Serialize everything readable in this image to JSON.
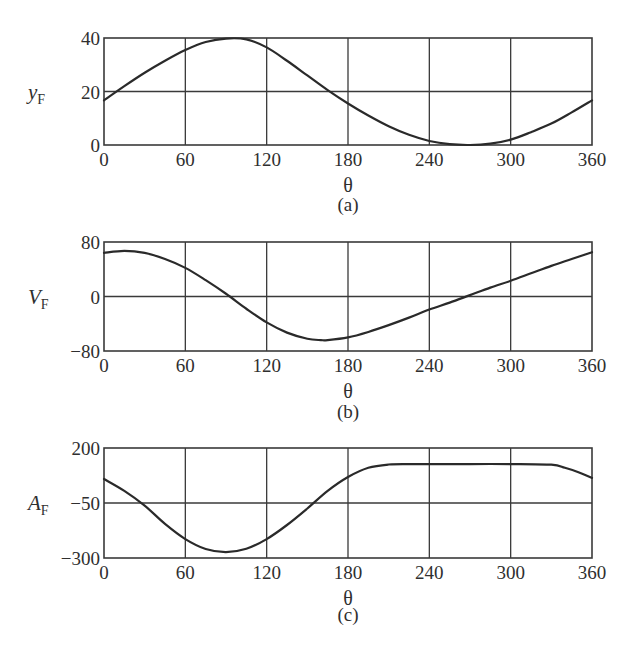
{
  "figure": {
    "panels": [
      {
        "id": "a",
        "caption": "(a)",
        "ylabel_main": "y",
        "ylabel_sub": "F",
        "xlabel": "θ"
      },
      {
        "id": "b",
        "caption": "(b)",
        "ylabel_main": "V",
        "ylabel_sub": "F",
        "xlabel": "θ"
      },
      {
        "id": "c",
        "caption": "(c)",
        "ylabel_main": "A",
        "ylabel_sub": "F",
        "xlabel": "θ"
      }
    ]
  },
  "chart_data": [
    {
      "type": "line",
      "title": "(a)",
      "xlabel": "θ",
      "ylabel": "y_F",
      "xlim": [
        0,
        360
      ],
      "ylim": [
        0,
        40
      ],
      "xticks": [
        0,
        60,
        120,
        180,
        240,
        300,
        360
      ],
      "yticks": [
        0,
        20,
        40
      ],
      "grid": true,
      "x": [
        0,
        15,
        30,
        45,
        60,
        75,
        90,
        105,
        120,
        135,
        150,
        165,
        180,
        195,
        210,
        225,
        240,
        255,
        270,
        285,
        300,
        315,
        330,
        345,
        360
      ],
      "values": [
        16.7,
        22,
        27,
        31.5,
        35.5,
        38.5,
        39.8,
        39.5,
        36.5,
        31.5,
        26,
        20.5,
        15.5,
        11,
        7,
        3.8,
        1.5,
        0.3,
        0,
        0.5,
        2,
        4.8,
        8,
        12.2,
        16.7
      ]
    },
    {
      "type": "line",
      "title": "(b)",
      "xlabel": "θ",
      "ylabel": "V_F",
      "xlim": [
        0,
        360
      ],
      "ylim": [
        -80,
        80
      ],
      "xticks": [
        0,
        60,
        120,
        180,
        240,
        300,
        360
      ],
      "yticks": [
        -80,
        0,
        80
      ],
      "grid": true,
      "x": [
        0,
        15,
        30,
        45,
        60,
        75,
        90,
        105,
        120,
        135,
        150,
        160,
        165,
        180,
        195,
        210,
        225,
        240,
        255,
        270,
        285,
        300,
        315,
        330,
        345,
        360
      ],
      "values": [
        64,
        67,
        64,
        55,
        42,
        24,
        4,
        -18,
        -38,
        -53,
        -62,
        -64,
        -64,
        -60,
        -52,
        -42,
        -31,
        -19,
        -9,
        2,
        13,
        23,
        34,
        45,
        55,
        65
      ]
    },
    {
      "type": "line",
      "title": "(c)",
      "xlabel": "θ",
      "ylabel": "A_F",
      "xlim": [
        0,
        360
      ],
      "ylim": [
        -300,
        200
      ],
      "xticks": [
        0,
        60,
        120,
        180,
        240,
        300,
        360
      ],
      "yticks": [
        -300,
        -50,
        200
      ],
      "grid": true,
      "x": [
        0,
        15,
        30,
        45,
        60,
        75,
        90,
        105,
        120,
        135,
        150,
        165,
        180,
        195,
        210,
        225,
        240,
        270,
        300,
        330,
        340,
        350,
        360
      ],
      "values": [
        59,
        5,
        -62,
        -145,
        -214,
        -259,
        -273,
        -258,
        -214,
        -150,
        -75,
        5,
        68,
        110,
        125,
        127,
        127,
        127,
        127,
        124,
        110,
        90,
        64
      ]
    }
  ]
}
